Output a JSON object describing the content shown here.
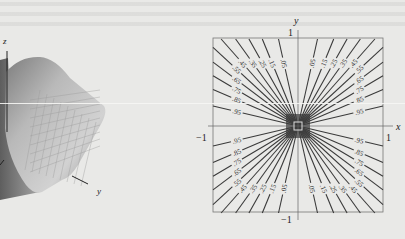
{
  "figure": {
    "surface_plot": {
      "axis_labels": {
        "z": "z",
        "y": "y"
      }
    },
    "chart_data": {
      "type": "contour",
      "title": "",
      "xlabel": "x",
      "ylabel": "y",
      "xlim": [
        -1,
        1
      ],
      "ylim": [
        -1,
        1
      ],
      "tick_labels": {
        "x_min": "−1",
        "x_max": "1",
        "y_min": "−1",
        "y_max": "1"
      },
      "grid": false,
      "contour_levels": [
        0.05,
        0.15,
        0.25,
        0.35,
        0.45,
        0.55,
        0.65,
        0.75,
        0.85,
        0.95
      ],
      "level_labels": [
        ".05",
        ".15",
        ".25",
        ".35",
        ".45",
        ".55",
        ".65",
        ".75",
        ".85",
        ".95"
      ],
      "level_curve_form": "radial lines through origin, one per level in each quadrant",
      "line_color": "#3a3a3a"
    }
  }
}
